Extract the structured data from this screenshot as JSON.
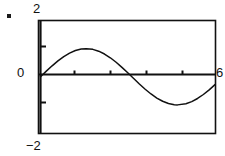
{
  "figure": {
    "bullet_marker": "square-bullet",
    "background_color": "#ffffff",
    "ink_color": "#111111"
  },
  "labels": {
    "y_max": "2",
    "y_min": "−2",
    "x_min": "0",
    "x_max": "6"
  },
  "chart_data": {
    "type": "line",
    "title": "",
    "subtitle": "",
    "xlabel": "",
    "ylabel": "",
    "xlim": [
      0,
      6
    ],
    "ylim": [
      -2,
      2
    ],
    "grid": false,
    "legend": null,
    "frame": "box",
    "x_axis_ticks": [
      1.2,
      2.4,
      3.6,
      4.8
    ],
    "x_axis_tick_labels": [
      "",
      "",
      "",
      ""
    ],
    "y_axis_ticks": [
      -1,
      1
    ],
    "y_axis_tick_labels": [
      "",
      ""
    ],
    "axis_tick_labels_shown": [
      "2",
      "0",
      "6",
      "−2"
    ],
    "series": [
      {
        "name": "sin(x)",
        "amplitude": 1,
        "zero_crossings": [
          0,
          3.14,
          6.28
        ],
        "peak": {
          "x": 1.57,
          "y": 1
        },
        "trough": {
          "x": 4.71,
          "y": -1
        },
        "x": [
          0,
          0.2,
          0.4,
          0.6,
          0.8,
          1.0,
          1.2,
          1.4,
          1.5708,
          1.8,
          2.0,
          2.2,
          2.4,
          2.6,
          2.8,
          3.0,
          3.1416,
          3.4,
          3.6,
          3.8,
          4.0,
          4.2,
          4.4,
          4.6,
          4.7124,
          5.0,
          5.2,
          5.4,
          5.6,
          5.8,
          6.0
        ],
        "y": [
          0,
          0.199,
          0.389,
          0.565,
          0.717,
          0.841,
          0.932,
          0.985,
          1.0,
          0.974,
          0.909,
          0.808,
          0.675,
          0.516,
          0.335,
          0.141,
          0,
          -0.256,
          -0.443,
          -0.612,
          -0.757,
          -0.872,
          -0.952,
          -0.994,
          -1.0,
          -0.959,
          -0.883,
          -0.773,
          -0.631,
          -0.465,
          -0.279
        ]
      }
    ]
  }
}
